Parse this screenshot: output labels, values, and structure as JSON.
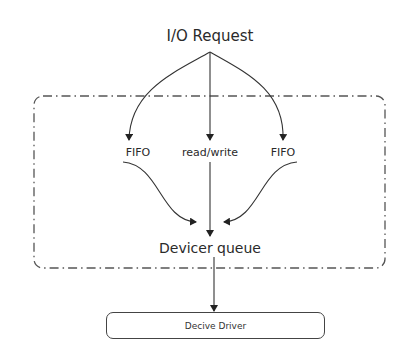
{
  "diagram": {
    "source_node": "I/O Request",
    "branches": [
      {
        "label": "FIFO",
        "position": "left"
      },
      {
        "label": "read/write",
        "position": "center"
      },
      {
        "label": "FIFO",
        "position": "right"
      }
    ],
    "queue_node": "Devicer queue",
    "driver_node": "Decive Driver",
    "container": {
      "style": "dash-dot",
      "rounded": true
    },
    "edges": [
      {
        "from": "I/O Request",
        "to": "FIFO (left)"
      },
      {
        "from": "I/O Request",
        "to": "read/write"
      },
      {
        "from": "I/O Request",
        "to": "FIFO (right)"
      },
      {
        "from": "FIFO (left)",
        "to": "Devicer queue"
      },
      {
        "from": "read/write",
        "to": "Devicer queue"
      },
      {
        "from": "FIFO (right)",
        "to": "Devicer queue"
      },
      {
        "from": "Devicer queue",
        "to": "Decive Driver"
      }
    ],
    "colors": {
      "stroke": "#333333",
      "container_stroke": "#555555",
      "background": "#ffffff"
    }
  }
}
